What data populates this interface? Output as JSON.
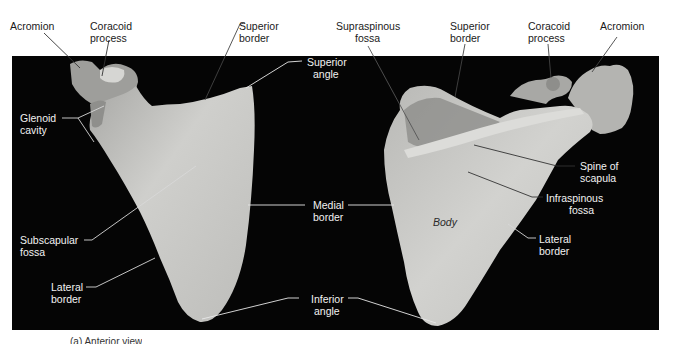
{
  "figure": {
    "background_panel_color": "#050505",
    "bone_color": "#c9c9c6",
    "label_color_on_white": "#1a1a1a",
    "label_color_on_black": "#f2f2f2",
    "left_view": {
      "labels": {
        "acromion": "Acromion",
        "coracoid_process_1": "Coracoid",
        "coracoid_process_2": "process",
        "superior_border_1": "Superior",
        "superior_border_2": "border",
        "superior_angle_1": "Superior",
        "superior_angle_2": "angle",
        "glenoid_cavity_1": "Glenoid",
        "glenoid_cavity_2": "cavity",
        "subscapular_fossa_1": "Subscapular",
        "subscapular_fossa_2": "fossa",
        "lateral_border_1": "Lateral",
        "lateral_border_2": "border"
      }
    },
    "shared": {
      "medial_border_1": "Medial",
      "medial_border_2": "border",
      "inferior_angle_1": "Inferior",
      "inferior_angle_2": "angle"
    },
    "right_view": {
      "labels": {
        "supraspinous_fossa_1": "Supraspinous",
        "supraspinous_fossa_2": "fossa",
        "superior_border_1": "Superior",
        "superior_border_2": "border",
        "coracoid_process_1": "Coracoid",
        "coracoid_process_2": "process",
        "acromion": "Acromion",
        "spine_of_scapula_1": "Spine of",
        "spine_of_scapula_2": "scapula",
        "infraspinous_fossa_1": "Infraspinous",
        "infraspinous_fossa_2": "fossa",
        "body": "Body",
        "lateral_border_1": "Lateral",
        "lateral_border_2": "border"
      }
    },
    "caption_partial": "(a) Anterior view"
  }
}
